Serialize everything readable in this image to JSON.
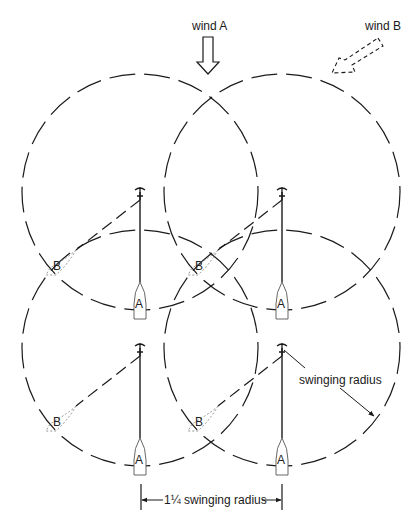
{
  "diagram": {
    "type": "anchoring-swing-circles",
    "labels": {
      "wind_a": "wind A",
      "wind_b": "wind B",
      "swinging_radius": "swinging radius",
      "spacing": "1¼ swinging radius"
    },
    "boats": [
      {
        "position": "top-left",
        "wind_a_label": "A",
        "wind_b_label": "B"
      },
      {
        "position": "top-right",
        "wind_a_label": "A",
        "wind_b_label": "B"
      },
      {
        "position": "bottom-left",
        "wind_a_label": "A",
        "wind_b_label": "B"
      },
      {
        "position": "bottom-right",
        "wind_a_label": "A",
        "wind_b_label": "B"
      }
    ],
    "colors": {
      "line": "#1a1a1a",
      "background": "#ffffff"
    }
  }
}
